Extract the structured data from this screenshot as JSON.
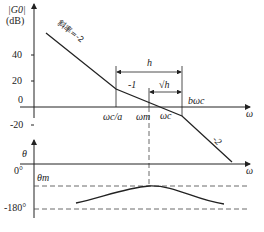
{
  "magnitude_plot": {
    "y_label_line1": "|G0|",
    "y_label_line2": "(dB)",
    "y_ticks": [
      "40",
      "20",
      "0",
      "-20"
    ],
    "x_axis_label": "ω",
    "slope_labels": {
      "first": "斜率=-2",
      "middle": "-1",
      "last": "-2"
    },
    "frequency_marks": {
      "low_corner": "ωc/a",
      "max_phase": "ωm",
      "crossover": "ωc",
      "high_corner": "bωc"
    },
    "interval_labels": {
      "h": "h",
      "sqrt_h": "√h"
    }
  },
  "phase_plot": {
    "y_label": "θ",
    "y_ticks": [
      "0°",
      "-180°"
    ],
    "peak_label": "θm"
  },
  "colors": {
    "line": "#222222",
    "dashed": "#444444",
    "background": "#ffffff"
  }
}
